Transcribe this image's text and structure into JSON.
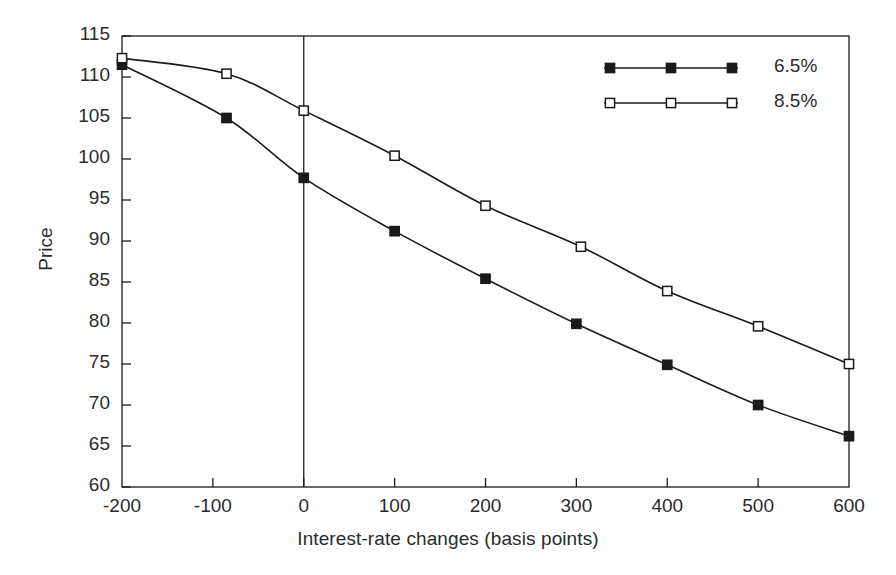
{
  "chart_data": {
    "type": "line",
    "title": "",
    "xlabel": "Interest-rate changes (basis points)",
    "ylabel": "Price",
    "xlim": [
      -200,
      600
    ],
    "ylim": [
      60,
      115
    ],
    "xticks": [
      -200,
      -100,
      0,
      100,
      200,
      300,
      400,
      500,
      600
    ],
    "xtick_labels": [
      "-200",
      "-100",
      "0",
      "100",
      "200",
      "300",
      "400",
      "500",
      "600"
    ],
    "yticks": [
      60,
      65,
      70,
      75,
      80,
      85,
      90,
      95,
      100,
      105,
      110,
      115
    ],
    "ytick_labels": [
      "60",
      "65",
      "70",
      "75",
      "80",
      "85",
      "90",
      "95",
      "100",
      "105",
      "110",
      "115"
    ],
    "grid": false,
    "zero_line": true,
    "legend_position": "top-right",
    "series": [
      {
        "name": "6.5%",
        "marker": "filled-square",
        "color": "#1a1a1a",
        "x": [
          -200,
          -85,
          0,
          100,
          200,
          300,
          400,
          500,
          600
        ],
        "values": [
          111.5,
          105.0,
          97.7,
          91.2,
          85.4,
          79.9,
          74.9,
          70.0,
          66.2
        ]
      },
      {
        "name": "8.5%",
        "marker": "open-square",
        "color": "#1a1a1a",
        "x": [
          -200,
          -85,
          0,
          100,
          200,
          305,
          400,
          500,
          600
        ],
        "values": [
          112.3,
          110.4,
          105.9,
          100.4,
          94.3,
          89.3,
          83.9,
          79.6,
          75.0
        ]
      }
    ]
  },
  "axes": {
    "x_title": "Interest-rate changes (basis points)",
    "y_title": "Price"
  },
  "legend": {
    "entries": [
      {
        "label": "6.5%",
        "marker": "filled-square"
      },
      {
        "label": "8.5%",
        "marker": "open-square"
      }
    ]
  }
}
